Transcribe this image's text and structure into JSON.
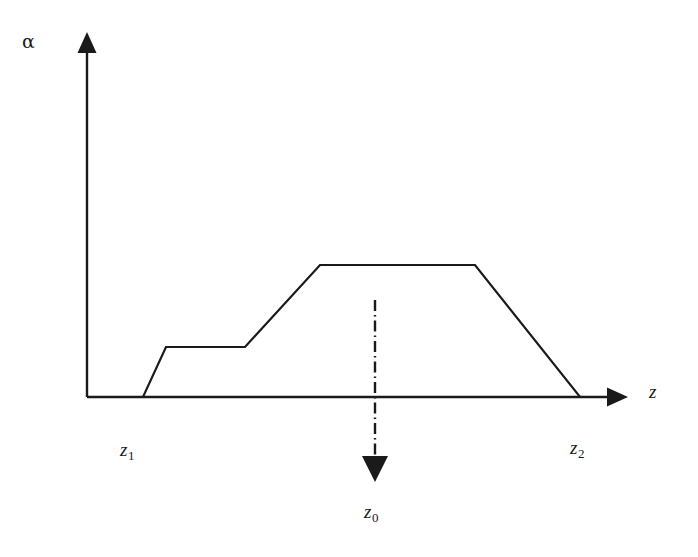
{
  "figure": {
    "background_color": "#ffffff",
    "line_color": "#1a1a1a",
    "axes": {
      "y_axis_label": "α",
      "x_axis_label": "z",
      "y_axis_label_name": "alpha",
      "x_axis_label_name": "z"
    },
    "annotations": {
      "z1": "z",
      "z1_sub": "1",
      "z2": "z",
      "z2_sub": "2",
      "z0": "z",
      "z0_sub": "0"
    }
  },
  "chart_data": {
    "type": "line",
    "title": "",
    "xlabel": "z",
    "ylabel": "α",
    "grid": false,
    "legend": null,
    "axis_style": "arrow-tipped half-axes, no tick marks, no numeric tick labels",
    "xlim": [
      0,
      1
    ],
    "ylim": [
      0,
      1
    ],
    "series": [
      {
        "name": "alpha profile",
        "style": "solid",
        "comment": "piecewise-linear absorption/attenuation profile: zero baseline, step up to a low plateau, ramp up to a high plateau, then linear decay back to zero",
        "points_px": [
          [
            87,
            397
          ],
          [
            143,
            397
          ],
          [
            166,
            347
          ],
          [
            245,
            347
          ],
          [
            320,
            265
          ],
          [
            475,
            265
          ],
          [
            580,
            397
          ],
          [
            626,
            397
          ]
        ],
        "normalized_points": [
          [
            0.0,
            0.0
          ],
          [
            0.104,
            0.0
          ],
          [
            0.147,
            0.38
          ],
          [
            0.293,
            0.38
          ],
          [
            0.432,
            1.0
          ],
          [
            0.719,
            1.0
          ],
          [
            0.914,
            0.0
          ],
          [
            1.0,
            0.0
          ]
        ]
      }
    ],
    "annotations": [
      {
        "name": "z1",
        "text": "z₁",
        "role": "lower profile edge / start of nonzero alpha",
        "x_px": 143
      },
      {
        "name": "z2",
        "text": "z₂",
        "role": "upper profile edge / end of nonzero alpha",
        "x_px": 580
      },
      {
        "name": "z0",
        "text": "z₀",
        "role": "dash-dot vertical marker with downward arrow",
        "x_px": 375
      }
    ],
    "marker_line": {
      "name": "z0-marker",
      "style": "dash-dot",
      "x_px": 375,
      "y_top_px": 300,
      "y_bottom_px": 482,
      "arrow": "down"
    }
  }
}
